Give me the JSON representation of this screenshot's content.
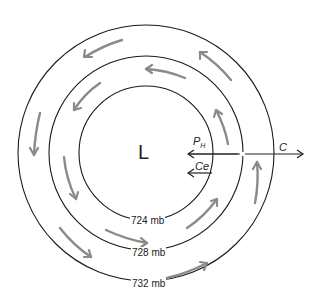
{
  "diagram": {
    "type": "low-pressure-isobar-wind-diagram",
    "center_label": "L",
    "isobars": [
      {
        "label": "724 mb",
        "radius": 67
      },
      {
        "label": "728 mb",
        "radius": 97
      },
      {
        "label": "732 mb",
        "radius": 128
      }
    ],
    "forces": {
      "pressure_gradient": {
        "symbol": "P",
        "subscript": "H"
      },
      "centrifugal": {
        "label": "Ce"
      },
      "coriolis": {
        "label": "C"
      }
    },
    "flow_direction": "counterclockwise",
    "colors": {
      "isobar": "#1a1a1a",
      "flow_arrow": "#8a8a8a",
      "force_arrow": "#222222"
    }
  }
}
